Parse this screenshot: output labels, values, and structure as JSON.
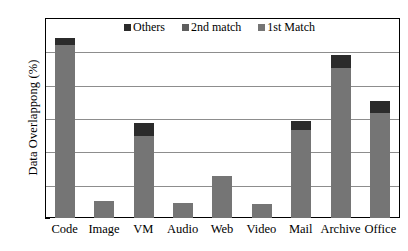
{
  "chart_data": {
    "type": "bar",
    "subtype": "stacked-vertical-bar",
    "title": "",
    "xlabel": "",
    "ylabel": "Data Overlappong (%)",
    "ylim": [
      0,
      1.2
    ],
    "ytick_labels": [
      "1.2",
      "1",
      "0.8",
      "0.6",
      "0.4",
      "0.2",
      "0"
    ],
    "ytick_values": [
      1.2,
      1,
      0.8,
      0.6,
      0.4,
      0.2,
      0
    ],
    "grid": true,
    "grid_axis": "y",
    "legend_position": "top-center-inside",
    "categories": [
      "Code",
      "Image",
      "VM",
      "Audio",
      "Web",
      "Video",
      "Mail",
      "Archive",
      "Office"
    ],
    "series": [
      {
        "name": "1st Match",
        "color": "#757575",
        "values": [
          1.04,
          0.1,
          0.49,
          0.09,
          0.25,
          0.085,
          0.53,
          0.9,
          0.63
        ]
      },
      {
        "name": "2nd match",
        "color": "#5e5e5e",
        "values": [
          0.0,
          0.0,
          0.0,
          0.0,
          0.0,
          0.0,
          0.0,
          0.0,
          0.0
        ]
      },
      {
        "name": "Others",
        "color": "#2b2b2b",
        "values": [
          0.04,
          0.0,
          0.08,
          0.0,
          0.0,
          0.0,
          0.05,
          0.08,
          0.07
        ]
      }
    ],
    "totals": [
      1.08,
      0.1,
      0.57,
      0.09,
      0.25,
      0.085,
      0.58,
      0.98,
      0.7
    ]
  },
  "legend": {
    "entries": [
      {
        "label": "Others",
        "color": "#2b2b2b"
      },
      {
        "label": "2nd match",
        "color": "#5e5e5e"
      },
      {
        "label": "1st Match",
        "color": "#757575"
      }
    ]
  }
}
